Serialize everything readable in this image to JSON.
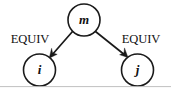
{
  "figure": {
    "background_color": "#ffffff",
    "ink_color": "#1a1a1a",
    "width": 171,
    "height": 89
  },
  "nodes": [
    {
      "id": "m",
      "label": "m",
      "name": "node-m",
      "cx": 84,
      "cy": 20,
      "r": 16
    },
    {
      "id": "i",
      "label": "i",
      "name": "node-i",
      "cx": 39.5,
      "cy": 70,
      "r": 16
    },
    {
      "id": "j",
      "label": "j",
      "name": "node-j",
      "cx": 137.5,
      "cy": 70,
      "r": 16
    }
  ],
  "edges": [
    {
      "id": "m-to-i",
      "from": "m",
      "to": "i",
      "label": "EQUIV",
      "label_x": 30,
      "label_y": 40,
      "direction": "down-left",
      "arrowhead": "filled-triangle"
    },
    {
      "id": "m-to-j",
      "from": "m",
      "to": "j",
      "label": "EQUIV",
      "label_x": 141,
      "label_y": 40,
      "direction": "down-right",
      "arrowhead": "filled-triangle"
    }
  ],
  "artifacts": {
    "bottom_scan_line_color": "#b9b9b9"
  }
}
